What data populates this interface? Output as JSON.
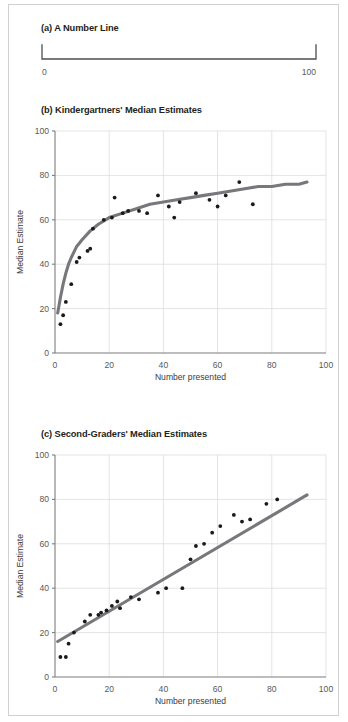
{
  "figure": {
    "background_color": "#ffffff",
    "frame_color": "#d2d2d2",
    "trend_color": "#77787b",
    "point_color": "#1a1a1a",
    "grid_color": "#d9d9d9",
    "axis_color": "#7d7d7d"
  },
  "panel_a": {
    "title": "(a) A Number Line",
    "left_label": "0",
    "right_label": "100"
  },
  "panel_b": {
    "title": "(b) Kindergartners' Median Estimates"
  },
  "panel_c": {
    "title": "(c) Second-Graders' Median Estimates"
  },
  "chart_data": [
    {
      "id": "panel-b",
      "type": "scatter",
      "title": "(b) Kindergartners' Median Estimates",
      "xlabel": "Number presented",
      "ylabel": "Median Estimate",
      "xlim": [
        0,
        100
      ],
      "ylim": [
        0,
        100
      ],
      "xticks": [
        0,
        20,
        40,
        60,
        80,
        100
      ],
      "yticks": [
        0,
        20,
        40,
        60,
        80,
        100
      ],
      "grid": true,
      "legend": "none",
      "points": [
        [
          2,
          13
        ],
        [
          3,
          17
        ],
        [
          4,
          23
        ],
        [
          6,
          31
        ],
        [
          8,
          41
        ],
        [
          9,
          43
        ],
        [
          12,
          46
        ],
        [
          13,
          47
        ],
        [
          14,
          56
        ],
        [
          18,
          60
        ],
        [
          21,
          61
        ],
        [
          22,
          70
        ],
        [
          25,
          63
        ],
        [
          27,
          64
        ],
        [
          31,
          64
        ],
        [
          34,
          63
        ],
        [
          38,
          71
        ],
        [
          42,
          66
        ],
        [
          44,
          61
        ],
        [
          46,
          68
        ],
        [
          52,
          72
        ],
        [
          57,
          69
        ],
        [
          60,
          66
        ],
        [
          63,
          71
        ],
        [
          68,
          77
        ],
        [
          73,
          67
        ]
      ],
      "fit": {
        "kind": "logarithmic",
        "description": "log-shaped best fit curve rising steeply then flattening",
        "curve": [
          [
            1,
            18
          ],
          [
            2,
            25
          ],
          [
            3,
            31
          ],
          [
            4,
            36
          ],
          [
            5,
            40
          ],
          [
            6,
            43
          ],
          [
            8,
            48
          ],
          [
            10,
            51
          ],
          [
            13,
            55
          ],
          [
            16,
            58
          ],
          [
            20,
            61
          ],
          [
            25,
            63
          ],
          [
            30,
            65
          ],
          [
            35,
            67
          ],
          [
            40,
            68
          ],
          [
            45,
            69
          ],
          [
            50,
            70
          ],
          [
            55,
            71
          ],
          [
            60,
            72
          ],
          [
            65,
            73
          ],
          [
            70,
            74
          ],
          [
            75,
            75
          ],
          [
            80,
            75
          ],
          [
            85,
            76
          ],
          [
            90,
            76
          ],
          [
            93,
            77
          ]
        ]
      }
    },
    {
      "id": "panel-c",
      "type": "scatter",
      "title": "(c) Second-Graders' Median Estimates",
      "xlabel": "Number presented",
      "ylabel": "Median Estimate",
      "xlim": [
        0,
        100
      ],
      "ylim": [
        0,
        100
      ],
      "xticks": [
        0,
        20,
        40,
        60,
        80,
        100
      ],
      "yticks": [
        0,
        20,
        40,
        60,
        80,
        100
      ],
      "grid": true,
      "legend": "none",
      "points": [
        [
          2,
          9
        ],
        [
          4,
          9
        ],
        [
          5,
          15
        ],
        [
          7,
          20
        ],
        [
          11,
          25
        ],
        [
          13,
          28
        ],
        [
          16,
          28
        ],
        [
          17,
          29
        ],
        [
          19,
          30
        ],
        [
          21,
          32
        ],
        [
          23,
          34
        ],
        [
          24,
          31
        ],
        [
          28,
          36
        ],
        [
          31,
          35
        ],
        [
          38,
          38
        ],
        [
          41,
          40
        ],
        [
          47,
          40
        ],
        [
          50,
          53
        ],
        [
          52,
          59
        ],
        [
          55,
          60
        ],
        [
          58,
          65
        ],
        [
          61,
          68
        ],
        [
          66,
          73
        ],
        [
          69,
          70
        ],
        [
          72,
          71
        ],
        [
          78,
          78
        ],
        [
          82,
          80
        ]
      ],
      "fit": {
        "kind": "linear",
        "description": "straight best fit line",
        "curve": [
          [
            1,
            16
          ],
          [
            93,
            82
          ]
        ]
      }
    }
  ]
}
